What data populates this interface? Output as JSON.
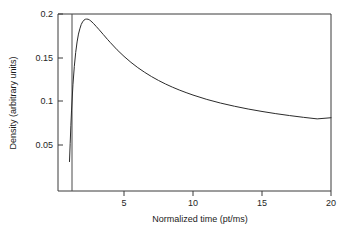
{
  "chart_data": {
    "type": "line",
    "title": "",
    "xlabel": "Normalized time (pt/ms)",
    "ylabel": "Density (arbitrary units)",
    "xlim": [
      0.55,
      20
    ],
    "ylim": [
      0.0221,
      0.2
    ],
    "xticks": [
      5,
      10,
      15,
      20
    ],
    "xtick_labels": [
      "5",
      "10",
      "15",
      "20"
    ],
    "yticks": [
      0.05,
      0.1,
      0.15,
      0.2
    ],
    "ytick_labels": [
      "0.05",
      "0.1",
      "0.15",
      "0.2"
    ],
    "grid": false,
    "legend": null,
    "line_color": "#2b2b2b",
    "frame_color": "#3a3a3a",
    "background": "#ffffff",
    "series": [
      {
        "name": "density",
        "x": [
          1.05,
          1.1,
          1.15,
          1.2,
          1.3,
          1.4,
          1.5,
          1.6,
          1.7,
          1.8,
          1.9,
          2.0,
          2.1,
          2.2,
          2.3,
          2.4,
          2.5,
          2.6,
          2.8,
          3.0,
          3.2,
          3.5,
          3.8,
          4.0,
          4.5,
          5.0,
          5.5,
          6.0,
          6.5,
          7.0,
          7.5,
          8.0,
          8.5,
          9.0,
          9.5,
          10.0,
          11.0,
          12.0,
          13.0,
          14.0,
          15.0,
          16.0,
          17.0,
          18.0,
          19.0,
          20.0
        ],
        "y": [
          0.031,
          0.052,
          0.072,
          0.09,
          0.119,
          0.14,
          0.156,
          0.168,
          0.177,
          0.183,
          0.188,
          0.191,
          0.193,
          0.194,
          0.1942,
          0.194,
          0.1932,
          0.192,
          0.189,
          0.1855,
          0.182,
          0.1765,
          0.171,
          0.1675,
          0.159,
          0.1515,
          0.1447,
          0.1386,
          0.1332,
          0.1283,
          0.1239,
          0.1199,
          0.1163,
          0.113,
          0.11,
          0.1072,
          0.1022,
          0.098,
          0.0944,
          0.0912,
          0.0884,
          0.0859,
          0.0837,
          0.0817,
          0.0799,
          0.0812
        ]
      }
    ]
  },
  "axes": {
    "x_label": "Normalized time (pt/ms)",
    "y_label": "Density (arbitrary units)",
    "x_tick_labels": [
      "5",
      "10",
      "15",
      "20"
    ],
    "y_tick_labels": [
      "0.2",
      "0.15",
      "0.1",
      "0.05"
    ]
  }
}
